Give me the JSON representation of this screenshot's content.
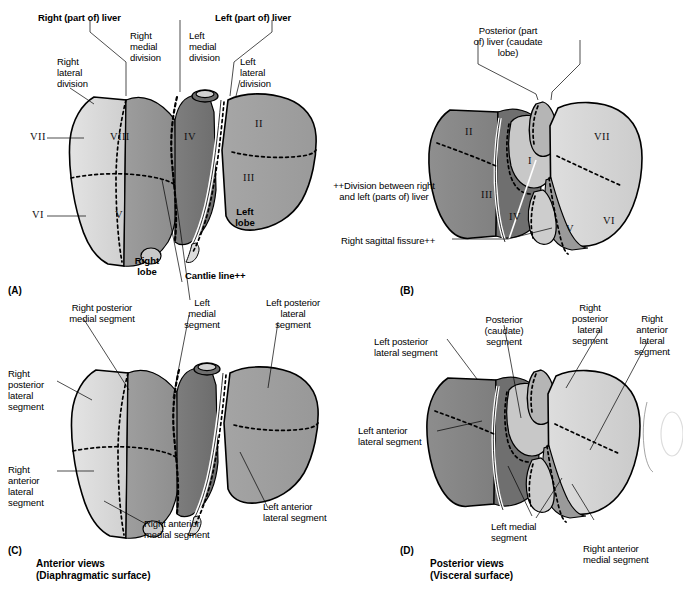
{
  "figure": {
    "panels": [
      {
        "id": "A",
        "mark": "(A)"
      },
      {
        "id": "B",
        "mark": "(B)"
      },
      {
        "id": "C",
        "mark": "(C)"
      },
      {
        "id": "D",
        "mark": "(D)"
      }
    ],
    "view_captions": {
      "anterior": "Anterior views\n(Diaphragmatic surface)",
      "posterior": "Posterior views\n(Visceral surface)"
    }
  },
  "panel_a": {
    "labels": {
      "right_part_liver": "Right (part of) liver",
      "left_part_liver": "Left (part of) liver",
      "right_medial_division": "Right\nmedial\ndivision",
      "left_medial_division": "Left\nmedial\ndivision",
      "right_lateral_division": "Right\nlateral\ndivision",
      "left_lateral_division": "Left\nlateral\ndivision",
      "right_lobe": "Right\nlobe",
      "left_lobe": "Left\nlobe",
      "cantlie_line": "Cantlie line++"
    },
    "segments": [
      "VII",
      "VIII",
      "IV",
      "II",
      "III",
      "VI",
      "V"
    ]
  },
  "panel_b": {
    "labels": {
      "posterior_caudate": "Posterior (part\nof) liver (caudate\nlobe)",
      "right_sagittal_fissure": "Right sagittal fissure++"
    },
    "segments": [
      "II",
      "III",
      "I",
      "IV",
      "VII",
      "VI",
      "V"
    ]
  },
  "footnote": {
    "division_note": "++Division between right\nand left (parts of) liver"
  },
  "panel_c": {
    "labels": {
      "right_posterior_medial": "Right posterior\nmedial segment",
      "right_posterior_lateral": "Right\nposterior\nlateral\nsegment",
      "right_anterior_lateral": "Right\nanterior\nlateral\nsegment",
      "right_anterior_medial": "Right anterior\nmedial segment",
      "left_medial": "Left\nmedial\nsegment",
      "left_posterior_lateral": "Left posterior\nlateral\nsegment",
      "left_anterior_lateral": "Left anterior\nlateral segment"
    }
  },
  "panel_d": {
    "labels": {
      "left_posterior_lateral": "Left posterior\nlateral segment",
      "left_anterior_lateral": "Left anterior\nlateral segment",
      "posterior_caudate_segment": "Posterior\n(caudate)\nsegment",
      "right_posterior_lateral": "Right\nposterior\nlateral\nsegment",
      "right_anterior_lateral": "Right\nanterior\nlateral\nsegment",
      "left_medial": "Left medial\nsegment",
      "right_anterior_medial": "Right anterior\nmedial segment"
    }
  },
  "colors": {
    "seg_light": "#d8d8d8",
    "seg_lightmid": "#c2c2c2",
    "seg_mid": "#a8a8a8",
    "seg_dark": "#8e8e8e",
    "seg_darker": "#787878",
    "seg_darkest": "#6a6a6a",
    "outline": "#000000",
    "paper": "#ffffff"
  }
}
